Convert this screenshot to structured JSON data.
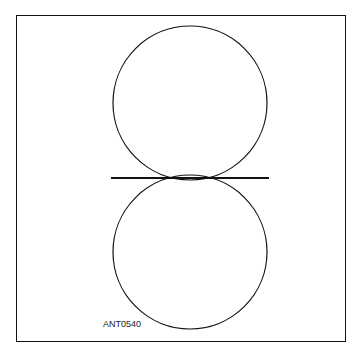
{
  "figure": {
    "label": "ANT0540",
    "colors": {
      "stroke": "#111111",
      "background": "#ffffff"
    }
  }
}
